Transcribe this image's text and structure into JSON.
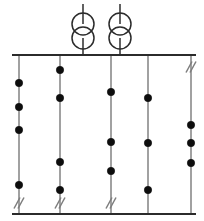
{
  "diagram": {
    "type": "electrical-single-line",
    "canvas": {
      "width": 204,
      "height": 221
    },
    "colors": {
      "busbar": "#2b2b2b",
      "feeder": "#8a8a8a",
      "transformer": "#2b2b2b",
      "breaker_dot": "#0d0d0d",
      "disconnector": "#7d7d7d",
      "background": "#ffffff"
    },
    "busbars": [
      {
        "name": "upper-busbar",
        "label": "Upper busbar",
        "y": 55,
        "x_start": 12,
        "x_end": 196
      },
      {
        "name": "lower-busbar",
        "label": "Lower busbar",
        "y": 214,
        "x_start": 12,
        "x_end": 196
      }
    ],
    "transformers": [
      {
        "name": "transformer-1",
        "label": "T1",
        "x": 83,
        "lead_top_y": 4,
        "upper_coil_cy": 24,
        "lower_coil_cy": 38,
        "coil_r": 11,
        "lead_bottom_y": 55
      },
      {
        "name": "transformer-2",
        "label": "T2",
        "x": 120,
        "lead_top_y": 4,
        "upper_coil_cy": 24,
        "lower_coil_cy": 38,
        "coil_r": 11,
        "lead_bottom_y": 55
      }
    ],
    "feeders": [
      {
        "name": "feeder-1",
        "label": "Feeder 1",
        "x": 19,
        "y_top": 55,
        "y_bottom": 214,
        "breakers": [
          83,
          107,
          130,
          185
        ],
        "disconnectors": [
          203
        ]
      },
      {
        "name": "feeder-2",
        "label": "Feeder 2",
        "x": 60,
        "y_top": 55,
        "y_bottom": 214,
        "breakers": [
          70,
          98,
          162,
          190
        ],
        "disconnectors": [
          203
        ]
      },
      {
        "name": "feeder-3",
        "label": "Feeder 3",
        "x": 111,
        "y_top": 55,
        "y_bottom": 214,
        "breakers": [
          92,
          142,
          171
        ],
        "disconnectors": [
          203
        ]
      },
      {
        "name": "feeder-4",
        "label": "Feeder 4",
        "x": 148,
        "y_top": 55,
        "y_bottom": 214,
        "breakers": [
          98,
          143,
          190
        ],
        "disconnectors": []
      },
      {
        "name": "feeder-5",
        "label": "Feeder 5",
        "x": 191,
        "y_top": 55,
        "y_bottom": 214,
        "breakers": [
          125,
          143,
          163
        ],
        "disconnectors": [
          67
        ]
      }
    ],
    "symbols": {
      "breaker_radius": 3.7,
      "disconnector": {
        "slash_len": 11,
        "slash_dx": 6,
        "slash_gap": 4
      }
    }
  }
}
